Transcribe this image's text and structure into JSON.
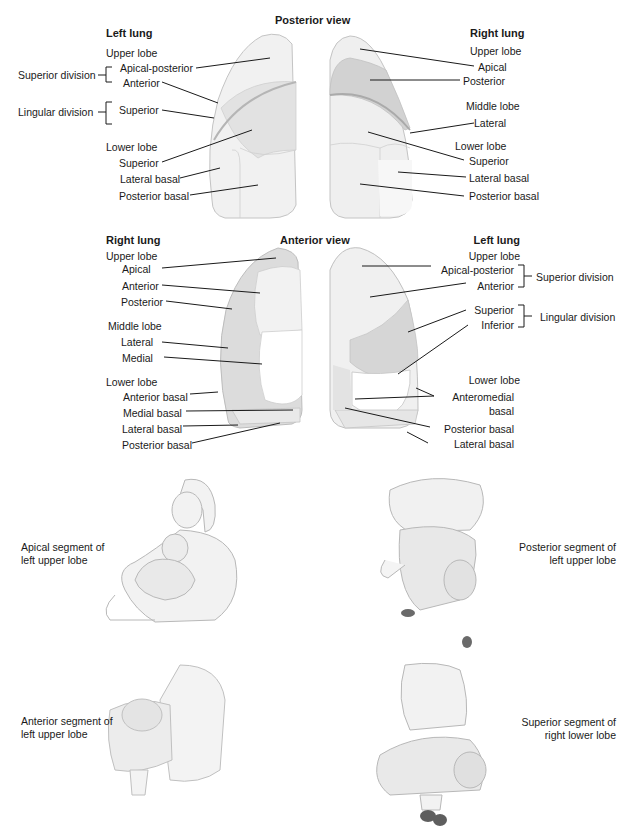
{
  "posterior": {
    "title": "Posterior view",
    "left_lung": {
      "heading": "Left lung",
      "upper_lobe": "Upper lobe",
      "superior_division": "Superior division",
      "apical_posterior": "Apical-posterior",
      "anterior": "Anterior",
      "lingular_division": "Lingular division",
      "superior": "Superior",
      "lower_lobe": "Lower lobe",
      "lower_superior": "Superior",
      "lateral_basal": "Lateral basal",
      "posterior_basal": "Posterior basal"
    },
    "right_lung": {
      "heading": "Right lung",
      "upper_lobe": "Upper lobe",
      "apical": "Apical",
      "posterior": "Posterior",
      "middle_lobe": "Middle lobe",
      "lateral": "Lateral",
      "lower_lobe": "Lower lobe",
      "superior": "Superior",
      "lateral_basal": "Lateral basal",
      "posterior_basal": "Posterior basal"
    }
  },
  "anterior": {
    "title": "Anterior view",
    "right_lung": {
      "heading": "Right lung",
      "upper_lobe": "Upper lobe",
      "apical": "Apical",
      "anterior": "Anterior",
      "posterior": "Posterior",
      "middle_lobe": "Middle lobe",
      "lateral": "Lateral",
      "medial": "Medial",
      "lower_lobe": "Lower lobe",
      "anterior_basal": "Anterior basal",
      "medial_basal": "Medial basal",
      "lateral_basal": "Lateral basal",
      "posterior_basal": "Posterior basal"
    },
    "left_lung": {
      "heading": "Left lung",
      "upper_lobe": "Upper lobe",
      "apical_posterior": "Apical-posterior",
      "anterior": "Anterior",
      "superior_division": "Superior division",
      "superior": "Superior",
      "inferior": "Inferior",
      "lingular_division": "Lingular division",
      "lower_lobe": "Lower lobe",
      "anteromedial_1": "Anteromedial",
      "anteromedial_2": "basal",
      "posterior_basal": "Posterior basal",
      "lateral_basal": "Lateral basal"
    }
  },
  "positions": [
    {
      "line1": "Apical segment of",
      "line2": "left upper lobe"
    },
    {
      "line1": "Posterior segment of",
      "line2": "left upper lobe"
    },
    {
      "line1": "Anterior segment of",
      "line2": "left upper lobe"
    },
    {
      "line1": "Superior segment of",
      "line2": "right lower lobe"
    }
  ],
  "colors": {
    "lung_light": "#efefef",
    "lung_mid": "#dedede",
    "lung_dark": "#c9c9c9",
    "outline": "#b8b8b8",
    "leader": "#1a1a1a"
  }
}
